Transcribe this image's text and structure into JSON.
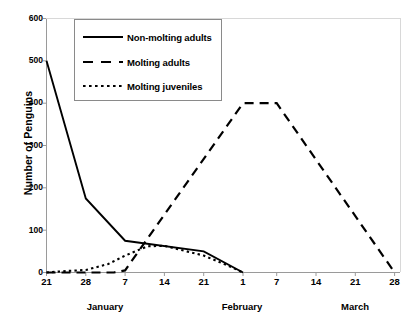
{
  "chart_data": {
    "type": "line",
    "title": "",
    "xlabel": "",
    "ylabel": "Number of Penguins",
    "ylim": [
      0,
      600
    ],
    "yticks": [
      0,
      100,
      200,
      300,
      400,
      500,
      600
    ],
    "grid": false,
    "legend_position": "top-left-inside",
    "x_tick_labels": [
      "21",
      "28",
      "7",
      "14",
      "21",
      "1",
      "7",
      "14",
      "21",
      "28"
    ],
    "x_tick_days": [
      21,
      28,
      35,
      42,
      49,
      56,
      62,
      69,
      76,
      83
    ],
    "month_labels": [
      "January",
      "February",
      "March"
    ],
    "month_positions": [
      28,
      52.5,
      76
    ],
    "series": [
      {
        "name": "Non-molting adults",
        "style": "solid",
        "color": "#000000",
        "x": [
          21,
          28,
          35,
          49,
          56
        ],
        "y": [
          500,
          175,
          75,
          50,
          0
        ]
      },
      {
        "name": "Molting adults",
        "style": "dashed",
        "color": "#000000",
        "x": [
          21,
          33,
          35,
          56,
          62,
          83
        ],
        "y": [
          0,
          0,
          5,
          400,
          400,
          0
        ]
      },
      {
        "name": "Molting juveniles",
        "style": "dotted",
        "color": "#000000",
        "x": [
          21,
          24,
          28,
          32,
          35,
          39,
          42,
          49,
          53,
          56
        ],
        "y": [
          0,
          3,
          6,
          20,
          40,
          62,
          63,
          40,
          18,
          0
        ]
      }
    ]
  },
  "axes": {
    "y_title": "Number of Penguins",
    "y_ticks": [
      "0",
      "100",
      "200",
      "300",
      "400",
      "500",
      "600"
    ],
    "x_ticks": [
      "21",
      "28",
      "7",
      "14",
      "21",
      "1",
      "7",
      "14",
      "21",
      "28"
    ],
    "months": [
      "January",
      "February",
      "March"
    ]
  },
  "legend": {
    "entries": [
      {
        "label": "Non-molting adults",
        "style": "solid"
      },
      {
        "label": "Molting adults",
        "style": "dashed"
      },
      {
        "label": "Molting juveniles",
        "style": "dotted"
      }
    ]
  }
}
